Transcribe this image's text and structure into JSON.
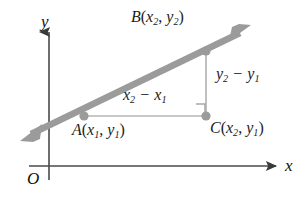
{
  "figure": {
    "kind": "coordinate-geometry-diagram",
    "background_color": "#ffffff",
    "axis_color": "#4a4a4a",
    "line_color": "#9b9b9b",
    "leg_color": "#b0b0b0",
    "point_color": "#9b9b9b",
    "text_color": "#1c1c1c",
    "width": 303,
    "height": 205
  },
  "axes": {
    "y_axis_label": "y",
    "x_axis_label": "x",
    "origin_label": "O",
    "y_axis_x": 49,
    "x_axis_y": 166,
    "y_axis_top": 30,
    "x_axis_right": 278
  },
  "points": {
    "a": {
      "label_prefix": "A",
      "x_sub": "1",
      "y_sub": "1",
      "cx": 84,
      "cy": 116,
      "r": 4.5
    },
    "b": {
      "label_prefix": "B",
      "x_sub": "2",
      "y_sub": "2",
      "cx": 206,
      "cy": 51,
      "r": 4.5
    },
    "c": {
      "label_prefix": "C",
      "x_sub": "2",
      "y_sub": "1",
      "cx": 206,
      "cy": 116,
      "r": 4.5
    }
  },
  "labels": {
    "point_a": {
      "name": "A",
      "x_var": "x",
      "x_sub": "1",
      "y_var": "y",
      "y_sub": "1"
    },
    "point_b": {
      "name": "B",
      "x_var": "x",
      "x_sub": "2",
      "y_var": "y",
      "y_sub": "2"
    },
    "point_c": {
      "name": "C",
      "x_var": "x",
      "x_sub": "2",
      "y_var": "y",
      "y_sub": "1"
    },
    "run": {
      "var": "x",
      "sub_minuend": "2",
      "sub_subtrahend": "1",
      "operator": "−"
    },
    "rise": {
      "var": "y",
      "sub_minuend": "2",
      "sub_subtrahend": "1",
      "operator": "−"
    },
    "open_paren": "(",
    "close_paren": ")",
    "comma": ", "
  },
  "line": {
    "through": [
      "A",
      "B"
    ],
    "arrow_start": {
      "x": 25,
      "y": 137
    },
    "arrow_end": {
      "x": 248,
      "y": 28
    },
    "stroke_width": 6,
    "double_headed": true
  },
  "right_angle_marker": {
    "x": 196,
    "y": 104,
    "size": 9,
    "at_point": "C"
  }
}
